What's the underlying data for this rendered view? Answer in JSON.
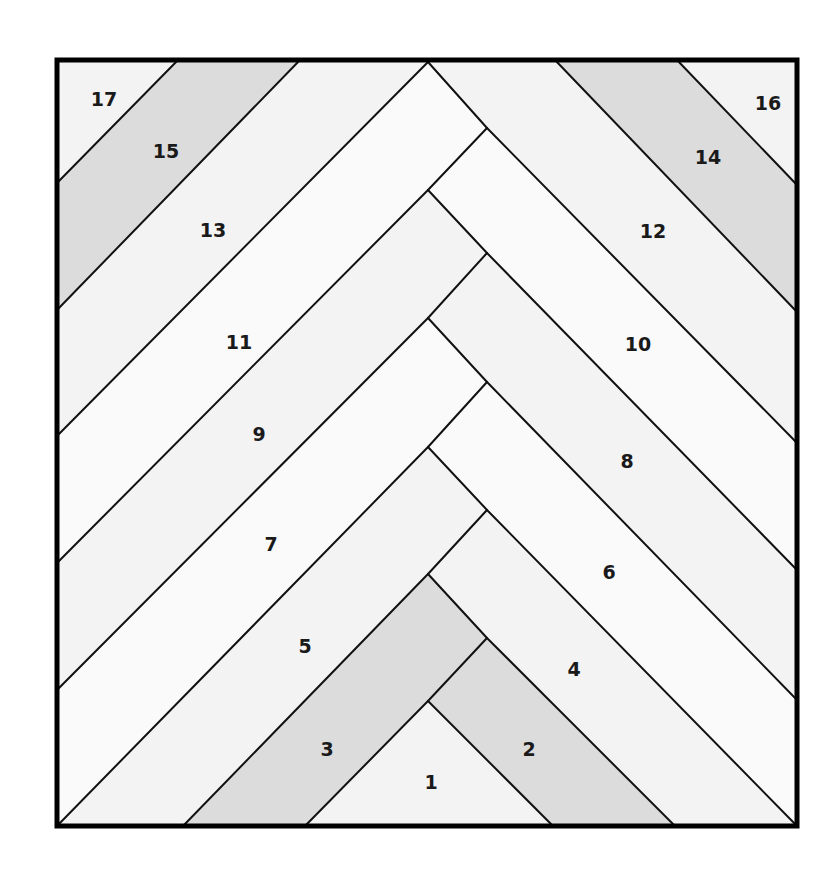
{
  "diagram": {
    "frame": {
      "x": 57,
      "y": 60,
      "w": 740,
      "h": 766
    },
    "colors": {
      "light": "#f3f3f3",
      "white": "#fafafa",
      "medium": "#dcdcdc",
      "line": "#111111",
      "frame": "#000000",
      "background": "#ffffff"
    },
    "pieces": [
      {
        "id": "1",
        "label": "1",
        "shade": "light",
        "x": 431,
        "y": 783,
        "points": "428,701 305,826 553,826"
      },
      {
        "id": "2",
        "label": "2",
        "shade": "medium",
        "x": 529,
        "y": 750,
        "points": "428,701 487,638 675,826 553,826"
      },
      {
        "id": "3",
        "label": "3",
        "shade": "medium",
        "x": 327,
        "y": 750,
        "points": "428,574 487,638 428,701 305,826 183,826"
      },
      {
        "id": "4",
        "label": "4",
        "shade": "light",
        "x": 574,
        "y": 670,
        "points": "428,574 487,510 797,826 675,826 487,638"
      },
      {
        "id": "5",
        "label": "5",
        "shade": "light",
        "x": 305,
        "y": 647,
        "points": "428,447 487,510 428,574 183,826 57,826"
      },
      {
        "id": "6",
        "label": "6",
        "shade": "white",
        "x": 609,
        "y": 573,
        "points": "428,447 487,382 797,700 797,826 487,510"
      },
      {
        "id": "7",
        "label": "7",
        "shade": "white",
        "x": 271,
        "y": 545,
        "points": "428,318 487,382 428,447 57,826 57,690"
      },
      {
        "id": "8",
        "label": "8",
        "shade": "light",
        "x": 627,
        "y": 462,
        "points": "428,318 487,253 797,570 797,700 487,382"
      },
      {
        "id": "9",
        "label": "9",
        "shade": "light",
        "x": 259,
        "y": 435,
        "points": "428,190 487,253 428,318 57,690 57,563"
      },
      {
        "id": "10",
        "label": "10",
        "shade": "white",
        "x": 638,
        "y": 345,
        "points": "428,190 487,128 797,443 797,570 487,253"
      },
      {
        "id": "11",
        "label": "11",
        "shade": "white",
        "x": 239,
        "y": 343,
        "points": "428,62 487,128 428,190 57,563 57,436"
      },
      {
        "id": "12",
        "label": "12",
        "shade": "light",
        "x": 653,
        "y": 232,
        "points": "428,62 555,60 797,312 797,443 487,128"
      },
      {
        "id": "13",
        "label": "13",
        "shade": "light",
        "x": 213,
        "y": 231,
        "points": "300,60 428,62 57,436 57,310"
      },
      {
        "id": "14",
        "label": "14",
        "shade": "medium",
        "x": 708,
        "y": 158,
        "points": "555,60 677,60 797,185 797,312"
      },
      {
        "id": "15",
        "label": "15",
        "shade": "medium",
        "x": 166,
        "y": 152,
        "points": "178,60 300,60 57,310 57,183"
      },
      {
        "id": "16",
        "label": "16",
        "shade": "light",
        "x": 768,
        "y": 104,
        "points": "677,60 797,60 797,185"
      },
      {
        "id": "17",
        "label": "17",
        "shade": "light",
        "x": 104,
        "y": 100,
        "points": "57,60 178,60 57,183"
      }
    ],
    "seams": [
      "428,701 305,826",
      "428,701 553,826",
      "428,701 487,638",
      "487,638 675,826",
      "487,638 428,574",
      "428,574 183,826",
      "428,574 487,510",
      "487,510 797,826",
      "487,510 428,447",
      "428,447 57,826",
      "428,447 487,382",
      "487,382 797,700",
      "487,382 428,318",
      "428,318 57,690",
      "428,318 487,253",
      "487,253 797,570",
      "487,253 428,190",
      "428,190 57,563",
      "428,190 487,128",
      "487,128 797,443",
      "487,128 428,62",
      "428,62 57,436",
      "555,60 797,312",
      "677,60 797,185",
      "300,60 57,310",
      "178,60 57,183"
    ]
  }
}
